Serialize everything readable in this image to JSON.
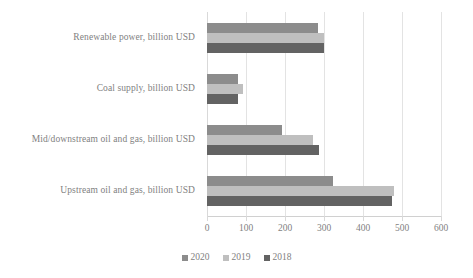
{
  "chart_data": {
    "type": "bar",
    "orientation": "horizontal",
    "title": "",
    "subtitle": "",
    "xlabel": "",
    "ylabel": "",
    "categories": [
      "Renewable power, billion USD",
      "Coal supply, billion USD",
      "Mid/downstream oil and gas, billion USD",
      "Upstream oil and gas, billion USD"
    ],
    "series": [
      {
        "name": "2020",
        "color": "#8c8c8c",
        "values": [
          284,
          79,
          192,
          323
        ]
      },
      {
        "name": "2019",
        "color": "#bfbfbf",
        "values": [
          300,
          92,
          272,
          479
        ]
      },
      {
        "name": "2018",
        "color": "#636363",
        "values": [
          300,
          79,
          287,
          474
        ]
      }
    ],
    "series_draw_order": [
      "2020",
      "2019",
      "2018"
    ],
    "xlim": [
      0,
      600
    ],
    "xticks": [
      0,
      100,
      200,
      300,
      400,
      500,
      600
    ],
    "xtick_labels": [
      "0",
      "100",
      "200",
      "300",
      "400",
      "500",
      "600"
    ],
    "grid": {
      "vertical": true,
      "horizontal": false
    },
    "legend": {
      "position": "bottom",
      "entries": [
        {
          "label": "2020",
          "color": "#8c8c8c"
        },
        {
          "label": "2019",
          "color": "#bfbfbf"
        },
        {
          "label": "2018",
          "color": "#636363"
        }
      ]
    },
    "colors": {
      "background": "#ffffff",
      "text": "#7f7f7f",
      "gridline": "#e3e3e3",
      "axis": "#d0d0d0"
    }
  }
}
